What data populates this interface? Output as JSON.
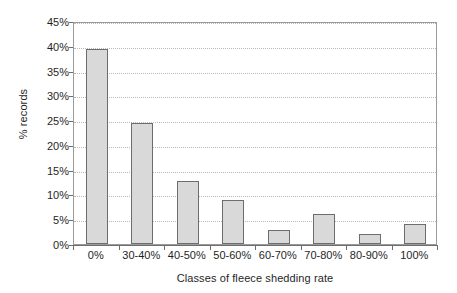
{
  "chart_data": {
    "type": "bar",
    "title": "",
    "subtitle": "",
    "xlabel": "Classes of fleece shedding rate",
    "ylabel": "% records",
    "categories": [
      "0%",
      "30-40%",
      "40-50%",
      "50-60%",
      "60-70%",
      "70-80%",
      "80-90%",
      "100%"
    ],
    "values": [
      39.3,
      24.4,
      12.7,
      8.8,
      2.9,
      6.0,
      2.1,
      4.0
    ],
    "ylim": [
      0,
      45
    ],
    "ytick_values": [
      0,
      5,
      10,
      15,
      20,
      25,
      30,
      35,
      40,
      45
    ],
    "ytick_labels": [
      "0%",
      "5%",
      "10%",
      "15%",
      "20%",
      "25%",
      "30%",
      "35%",
      "40%",
      "45%"
    ],
    "grid": "horizontal-dotted",
    "legend": "none",
    "bar_fill_color": "#d9d9d9",
    "bar_border_color": "#6d6d6d",
    "gridline_color": "#b9b9b9",
    "axis_color": "#6e6e6e",
    "background_color": "#ffffff"
  }
}
